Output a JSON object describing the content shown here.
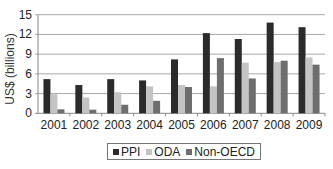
{
  "chart_data": {
    "type": "bar",
    "title": "",
    "xlabel": "",
    "ylabel": "US$ (billions)",
    "ylim": [
      0,
      15
    ],
    "yticks": [
      0,
      3,
      6,
      9,
      12,
      15
    ],
    "grid": true,
    "legend_position": "bottom",
    "categories": [
      "2001",
      "2002",
      "2003",
      "2004",
      "2005",
      "2006",
      "2007",
      "2008",
      "2009"
    ],
    "series": [
      {
        "name": "PPI",
        "color": "#2b2b2b",
        "values": [
          5.2,
          4.3,
          5.2,
          5.0,
          8.2,
          12.2,
          11.3,
          13.8,
          13.1
        ]
      },
      {
        "name": "ODA",
        "color": "#c4c4c4",
        "values": [
          2.9,
          2.4,
          3.2,
          4.1,
          4.3,
          4.1,
          7.7,
          7.8,
          8.5
        ]
      },
      {
        "name": "Non-OECD",
        "color": "#6e6e6e",
        "values": [
          0.6,
          0.55,
          1.3,
          1.9,
          4.0,
          8.4,
          5.3,
          8.0,
          7.4
        ]
      }
    ]
  },
  "legend": {
    "items": [
      {
        "label": "PPI",
        "color": "#2b2b2b"
      },
      {
        "label": "ODA",
        "color": "#c4c4c4"
      },
      {
        "label": "Non-OECD",
        "color": "#6e6e6e"
      }
    ]
  }
}
